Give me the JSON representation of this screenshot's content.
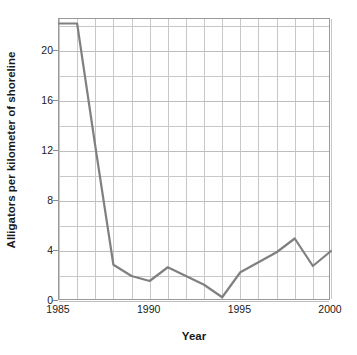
{
  "chart_data": {
    "type": "line",
    "title": "",
    "xlabel": "Year",
    "ylabel": "Alligators per kilometer of shoreline",
    "xlim": [
      1985,
      2000
    ],
    "ylim": [
      0,
      22.56
    ],
    "xticks": [
      1985,
      1990,
      1995,
      2000
    ],
    "yticks": [
      0,
      4,
      8,
      12,
      16,
      20
    ],
    "grid": true,
    "legend": false,
    "x": [
      1985,
      1986,
      1987,
      1988,
      1989,
      1990,
      1991,
      1992,
      1993,
      1994,
      1995,
      1996,
      1997,
      1998,
      1999,
      2000
    ],
    "values": [
      22.2,
      22.2,
      12.4,
      2.9,
      2.0,
      1.6,
      2.7,
      2.0,
      1.3,
      0.3,
      2.3,
      3.1,
      3.9,
      5.0,
      2.8,
      4.0
    ],
    "series": [
      {
        "name": "Alligators per kilometer of shoreline",
        "values": [
          22.2,
          22.2,
          12.4,
          2.9,
          2.0,
          1.6,
          2.7,
          2.0,
          1.3,
          0.3,
          2.3,
          3.1,
          3.9,
          5.0,
          2.8,
          4.0
        ]
      }
    ],
    "line_color": "#808080",
    "grid_color": "#c8c8c8",
    "frame_color": "#9a9a9a",
    "text_color": "#1a1a1a"
  },
  "axis": {
    "y_title": "Alligators per kilometer of shoreline",
    "x_title": "Year",
    "y_tick_labels": [
      "20",
      "16",
      "12",
      "8",
      "4",
      "0"
    ],
    "x_tick_labels": [
      "1985",
      "1990",
      "1995",
      "2000"
    ]
  }
}
